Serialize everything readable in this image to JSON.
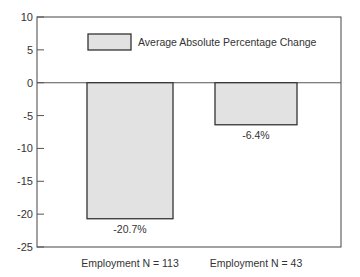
{
  "chart_data": {
    "type": "bar",
    "title": "",
    "xlabel": "",
    "ylabel": "",
    "ylim": [
      -25,
      10
    ],
    "yticks": [
      10,
      5,
      0,
      -5,
      -10,
      -15,
      -20,
      -25
    ],
    "ytick_labels": [
      "10",
      "5",
      "0",
      "-5",
      "-10",
      "-15",
      "-20",
      "-25"
    ],
    "categories": [
      "Employment N = 113",
      "Employment N = 43"
    ],
    "series": [
      {
        "name": "Average Absolute Percentage Change",
        "values": [
          -20.7,
          -6.4
        ]
      }
    ],
    "data_labels": [
      "-20.7%",
      "-6.4%"
    ],
    "legend": {
      "position": "top-center",
      "entries": [
        "Average Absolute Percentage Change"
      ]
    },
    "grid": false,
    "colors": {
      "bar_fill": "#e2e2e2",
      "bar_stroke": "#333333",
      "axis": "#555555"
    }
  }
}
